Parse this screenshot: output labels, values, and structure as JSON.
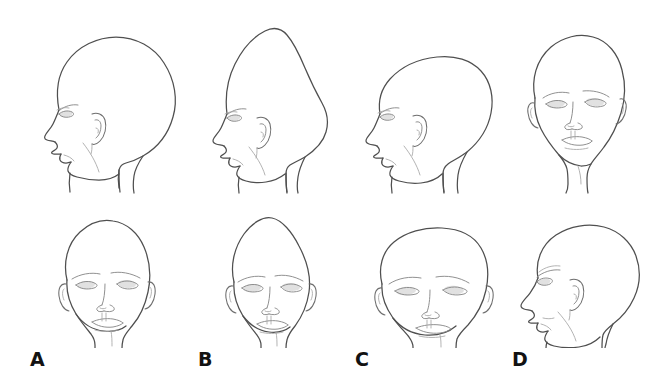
{
  "figure": {
    "background_color": "#ffffff",
    "outline_color": "#4f4f4f",
    "feature_color": "#8a8a8a",
    "label_color": "#121212",
    "rows": [
      {
        "name": "top-row",
        "view": "lateral profile (A, B, C) and frontal (D)"
      },
      {
        "name": "bottom-row",
        "view": "frontal (A, B, C) and oblique profile (D)"
      }
    ],
    "columns": [
      {
        "label": "A",
        "label_x": 30,
        "label_y": 350,
        "top_view": "profile",
        "bottom_view": "frontal",
        "shape": "scaphocephaly",
        "description": "Long narrow skull with prominent occipital bulge, normal height"
      },
      {
        "label": "B",
        "label_x": 198,
        "label_y": 350,
        "top_view": "profile",
        "bottom_view": "frontal",
        "shape": "turricephaly",
        "description": "Tall peaked vertex with pointed crown, narrow frontal width"
      },
      {
        "label": "C",
        "label_x": 355,
        "label_y": 350,
        "top_view": "profile",
        "bottom_view": "frontal",
        "shape": "brachycephaly",
        "description": "Flat recessed forehead with wide flat-topped broad skull"
      },
      {
        "label": "D",
        "label_x": 512,
        "label_y": 350,
        "top_view": "frontal",
        "bottom_view": "oblique profile",
        "shape": "plagiocephaly",
        "description": "Asymmetric skull with unilateral flattening and facial asymmetry"
      }
    ],
    "labels": [
      "A",
      "B",
      "C",
      "D"
    ]
  }
}
